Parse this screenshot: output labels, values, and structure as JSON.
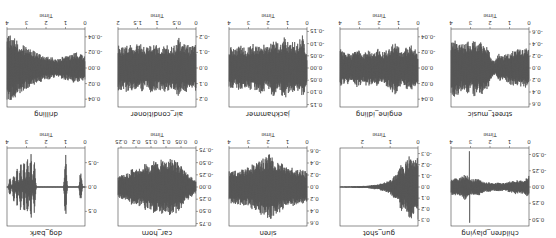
{
  "figure": {
    "orientation": "rotated-180",
    "color": "#555555"
  },
  "chart_data": [
    {
      "type": "line",
      "title": "children_playing",
      "xlabel": "Time",
      "ylabel": "",
      "xticks": [
        "0",
        "1",
        "2",
        "3",
        "4"
      ],
      "yticks": [
        "-0.50",
        "-0.25",
        "0.00",
        "0.25",
        "0.50"
      ],
      "ylim": [
        -0.6,
        0.6
      ],
      "xlim": [
        0,
        4
      ],
      "envelope": [
        0.18,
        0.12,
        0.1,
        0.1,
        0.12,
        0.1,
        0.08,
        0.06,
        0.06,
        0.07,
        0.06,
        0.06,
        0.08,
        0.07,
        0.1,
        0.15,
        0.12,
        0.12,
        0.18,
        0.2,
        0.15,
        0.12,
        0.14,
        0.12
      ],
      "spikes": [
        {
          "x": 3.05,
          "amp": 0.55
        }
      ]
    },
    {
      "type": "line",
      "title": "gun_shot",
      "xlabel": "Time",
      "ylabel": "",
      "xticks": [
        "0",
        "1",
        "2"
      ],
      "yticks": [
        "-0.3",
        "-0.2",
        "-0.1",
        "0.0",
        "0.1",
        "0.2",
        "0.3"
      ],
      "ylim": [
        -0.35,
        0.35
      ],
      "xlim": [
        0,
        2.8
      ],
      "envelope": [
        0.3,
        0.25,
        0.3,
        0.28,
        0.18,
        0.22,
        0.12,
        0.1,
        0.07,
        0.05,
        0.04,
        0.03,
        0.02,
        0.02,
        0.015,
        0.01,
        0.01,
        0.01,
        0.008,
        0.008,
        0.006,
        0.006,
        0.005,
        0.005
      ]
    },
    {
      "type": "line",
      "title": "siren",
      "xlabel": "Time",
      "ylabel": "",
      "xticks": [
        "0",
        "1",
        "2",
        "3",
        "4"
      ],
      "yticks": [
        "-0.6",
        "-0.4",
        "-0.2",
        "0.0",
        "0.2",
        "0.4",
        "0.6"
      ],
      "ylim": [
        -0.65,
        0.65
      ],
      "xlim": [
        0,
        4
      ],
      "envelope": [
        0.25,
        0.28,
        0.3,
        0.3,
        0.32,
        0.34,
        0.36,
        0.38,
        0.42,
        0.45,
        0.5,
        0.55,
        0.52,
        0.48,
        0.45,
        0.4,
        0.38,
        0.35,
        0.33,
        0.32,
        0.3,
        0.3,
        0.28,
        0.28
      ]
    },
    {
      "type": "line",
      "title": "car_horn",
      "xlabel": "Time",
      "ylabel": "",
      "xticks": [
        "0",
        "0.05",
        "0.1",
        "0.15",
        "0.2",
        "0.25"
      ],
      "yticks": [
        "-0.75",
        "-0.50",
        "-0.25",
        "0.00",
        "0.25",
        "0.50",
        "0.75"
      ],
      "ylim": [
        -0.8,
        0.8
      ],
      "xlim": [
        0,
        0.26
      ],
      "envelope": [
        0.12,
        0.18,
        0.25,
        0.3,
        0.4,
        0.5,
        0.55,
        0.6,
        0.58,
        0.55,
        0.6,
        0.5,
        0.55,
        0.52,
        0.45,
        0.48,
        0.42,
        0.4,
        0.35,
        0.38,
        0.3,
        0.28,
        0.25,
        0.22
      ]
    },
    {
      "type": "line",
      "title": "dog_bark",
      "xlabel": "Time",
      "ylabel": "",
      "xticks": [
        "0",
        "1",
        "2",
        "3",
        "4"
      ],
      "yticks": [
        "-0.5",
        "0.0",
        "0.5"
      ],
      "ylim": [
        -0.8,
        0.8
      ],
      "xlim": [
        0,
        4
      ],
      "bursts": [
        {
          "x": 0.22,
          "amp": 0.35
        },
        {
          "x": 1.0,
          "amp": 0.7
        },
        {
          "x": 2.6,
          "amp": 0.6
        },
        {
          "x": 2.78,
          "amp": 0.75
        },
        {
          "x": 2.95,
          "amp": 0.7
        },
        {
          "x": 3.12,
          "amp": 0.65
        },
        {
          "x": 3.3,
          "amp": 0.55
        },
        {
          "x": 3.48,
          "amp": 0.4
        },
        {
          "x": 3.65,
          "amp": 0.3
        },
        {
          "x": 3.85,
          "amp": 0.2
        }
      ]
    },
    {
      "type": "line",
      "title": "street_music",
      "xlabel": "Time",
      "ylabel": "",
      "xticks": [
        "0",
        "1",
        "2",
        "3",
        "4"
      ],
      "yticks": [
        "-0.6",
        "-0.4",
        "-0.2",
        "0.0",
        "0.2",
        "0.4",
        "0.6"
      ],
      "ylim": [
        -0.65,
        0.65
      ],
      "xlim": [
        0,
        4
      ],
      "envelope": [
        0.3,
        0.35,
        0.3,
        0.35,
        0.28,
        0.3,
        0.25,
        0.22,
        0.2,
        0.25,
        0.12,
        0.15,
        0.35,
        0.4,
        0.45,
        0.38,
        0.5,
        0.4,
        0.45,
        0.42,
        0.4,
        0.45,
        0.48,
        0.5
      ]
    },
    {
      "type": "line",
      "title": "engine_idling",
      "xlabel": "Time",
      "ylabel": "",
      "xticks": [
        "0",
        "1",
        "2",
        "3",
        "4"
      ],
      "yticks": [
        "-0.04",
        "-0.02",
        "0.00",
        "0.02",
        "0.04"
      ],
      "ylim": [
        -0.05,
        0.05
      ],
      "xlim": [
        0,
        4
      ],
      "envelope": [
        0.02,
        0.025,
        0.03,
        0.028,
        0.025,
        0.022,
        0.03,
        0.035,
        0.028,
        0.025,
        0.02,
        0.022,
        0.025,
        0.02,
        0.022,
        0.025,
        0.018,
        0.022,
        0.025,
        0.02,
        0.018,
        0.022,
        0.02,
        0.025
      ]
    },
    {
      "type": "line",
      "title": "jackhammer",
      "xlabel": "Time",
      "ylabel": "",
      "xticks": [
        "0",
        "1",
        "2",
        "3",
        "4"
      ],
      "yticks": [
        "-0.15",
        "-0.10",
        "-0.05",
        "0.00",
        "0.05",
        "0.10",
        "0.15"
      ],
      "ylim": [
        -0.16,
        0.16
      ],
      "xlim": [
        0,
        4
      ],
      "envelope": [
        0.05,
        0.14,
        0.12,
        0.1,
        0.11,
        0.1,
        0.12,
        0.13,
        0.1,
        0.11,
        0.12,
        0.1,
        0.09,
        0.1,
        0.11,
        0.09,
        0.1,
        0.09,
        0.08,
        0.09,
        0.1,
        0.08,
        0.09,
        0.08
      ]
    },
    {
      "type": "line",
      "title": "air_conditioner",
      "xlabel": "Time",
      "ylabel": "",
      "xticks": [
        "0",
        "0.5",
        "1",
        "1.5",
        "2"
      ],
      "yticks": [
        "-0.2",
        "-0.1",
        "0.0",
        "0.1",
        "0.2"
      ],
      "ylim": [
        -0.25,
        0.25
      ],
      "xlim": [
        0,
        2
      ],
      "envelope": [
        0.15,
        0.15,
        0.14,
        0.16,
        0.15,
        0.2,
        0.15,
        0.14,
        0.15,
        0.16,
        0.15,
        0.14,
        0.15,
        0.16,
        0.15,
        0.14,
        0.15,
        0.16,
        0.14,
        0.15,
        0.16,
        0.15,
        0.14,
        0.15
      ]
    },
    {
      "type": "line",
      "title": "drilling",
      "xlabel": "Time",
      "ylabel": "",
      "xticks": [
        "0",
        "1",
        "2",
        "3",
        "4"
      ],
      "yticks": [
        "-0.04",
        "-0.02",
        "0.00",
        "0.02",
        "0.04"
      ],
      "ylim": [
        -0.05,
        0.05
      ],
      "xlim": [
        0,
        4
      ],
      "envelope": [
        0.015,
        0.018,
        0.02,
        0.02,
        0.018,
        0.016,
        0.015,
        0.014,
        0.012,
        0.013,
        0.014,
        0.015,
        0.016,
        0.018,
        0.02,
        0.022,
        0.024,
        0.026,
        0.03,
        0.032,
        0.035,
        0.04,
        0.042,
        0.045
      ]
    }
  ]
}
